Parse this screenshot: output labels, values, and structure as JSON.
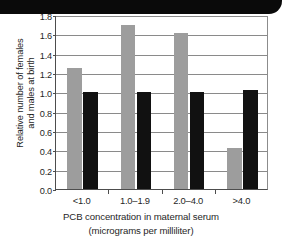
{
  "banner": {
    "label": ""
  },
  "chart_data": {
    "type": "bar",
    "title": "",
    "subtitle": "",
    "categories": [
      "<1.0",
      "1.0–1.9",
      "2.0–4.0",
      ">4.0"
    ],
    "series": [
      {
        "name": "females",
        "color": "#9d9d9d",
        "values": [
          1.25,
          1.7,
          1.61,
          0.42
        ]
      },
      {
        "name": "males",
        "color": "#111111",
        "values": [
          1.0,
          1.0,
          1.0,
          1.02
        ]
      }
    ],
    "xlabel": "PCB concentration in maternal serum (micrograms per milliliter)",
    "xlabel_lines": [
      "PCB concentration in maternal serum",
      "(micrograms per milliliter)"
    ],
    "ylabel": "Relative number of females and males at birth",
    "ylabel_lines": [
      "Relative number of females",
      "and males at birth"
    ],
    "ylim": [
      0.0,
      1.8
    ],
    "ytick_step": 0.2,
    "ytick_labels": [
      "0.0",
      "0.2",
      "0.4",
      "0.6",
      "0.8",
      "1.0",
      "1.2",
      "1.4",
      "1.6",
      "1.8"
    ],
    "grid": true,
    "grid_axis": "y",
    "legend": "none",
    "legend_position": "none"
  }
}
